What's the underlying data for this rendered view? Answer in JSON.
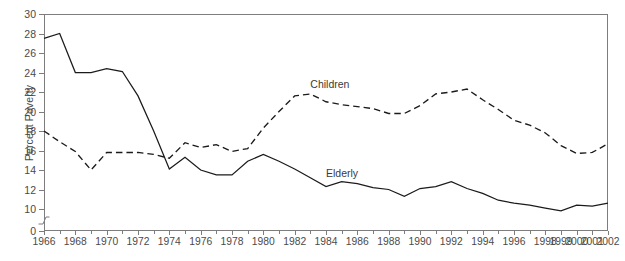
{
  "chart_data": {
    "type": "line",
    "title": "",
    "xlabel": "",
    "ylabel": "Percent Poverty",
    "ylim": [
      0,
      30
    ],
    "yticks": [
      0,
      10,
      12,
      14,
      16,
      18,
      20,
      22,
      24,
      26,
      28,
      30
    ],
    "axis_break": true,
    "axis_break_between": [
      0,
      10
    ],
    "grid": false,
    "legend_position": "inline-annotations",
    "x": [
      1966,
      1967,
      1968,
      1969,
      1970,
      1971,
      1972,
      1973,
      1974,
      1975,
      1976,
      1977,
      1978,
      1979,
      1980,
      1981,
      1982,
      1983,
      1984,
      1985,
      1986,
      1987,
      1988,
      1989,
      1990,
      1991,
      1992,
      1993,
      1994,
      1995,
      1996,
      1997,
      1998,
      1999,
      2000,
      2001,
      2002
    ],
    "xtick_labels": [
      "1966",
      "1968",
      "1970",
      "1972",
      "1974",
      "1976",
      "1978",
      "1980",
      "1982",
      "1984",
      "1986",
      "1988",
      "1990",
      "1992",
      "1994",
      "1996",
      "1998",
      "1999",
      "2000",
      "2001",
      "2002"
    ],
    "xtick_values": [
      1966,
      1968,
      1970,
      1972,
      1974,
      1976,
      1978,
      1980,
      1982,
      1984,
      1986,
      1988,
      1990,
      1992,
      1994,
      1996,
      1998,
      1999,
      2000,
      2001,
      2002
    ],
    "series": [
      {
        "name": "Children",
        "style": "dashed",
        "color": "#1b1b1b",
        "label_text": "Children",
        "values": [
          18.0,
          16.9,
          15.9,
          14.0,
          15.8,
          15.8,
          15.8,
          15.6,
          15.2,
          16.8,
          16.3,
          16.6,
          15.9,
          16.2,
          18.3,
          20.0,
          21.6,
          21.8,
          21.0,
          20.7,
          20.5,
          20.3,
          19.8,
          19.8,
          20.6,
          21.8,
          22.0,
          22.3,
          21.2,
          20.2,
          19.1,
          18.6,
          17.8,
          16.5,
          15.7,
          15.8,
          16.7
        ]
      },
      {
        "name": "Elderly",
        "style": "solid",
        "color": "#1b1b1b",
        "label_text": "Elderly",
        "values": [
          27.5,
          28.0,
          24.0,
          24.0,
          24.4,
          24.1,
          21.6,
          18.0,
          14.1,
          15.3,
          14.0,
          13.5,
          13.5,
          14.9,
          15.6,
          14.9,
          14.1,
          13.2,
          12.3,
          12.8,
          12.6,
          12.2,
          12.0,
          11.3,
          12.1,
          12.3,
          12.8,
          12.1,
          11.6,
          10.9,
          10.6,
          10.4,
          10.1,
          9.8,
          10.4,
          10.3,
          10.6
        ]
      }
    ],
    "annotations": [
      {
        "name": "children-label",
        "text": "Children",
        "x": 1983,
        "y": 22.7
      },
      {
        "name": "elderly-label",
        "text": "Elderly",
        "x": 1984,
        "y": 13.6
      }
    ]
  }
}
